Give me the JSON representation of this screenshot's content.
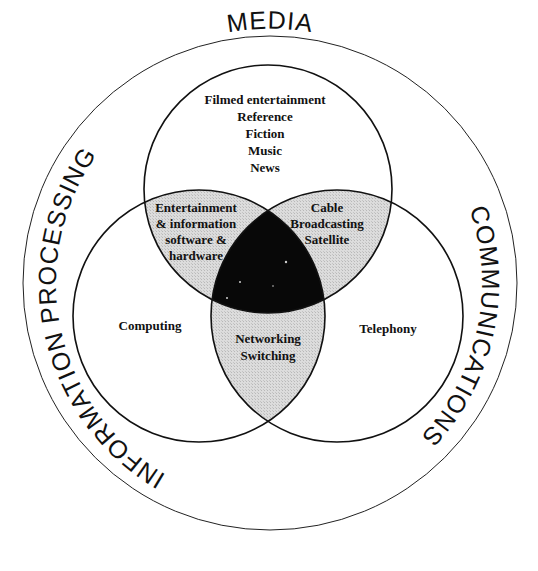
{
  "diagram": {
    "type": "venn",
    "outer_ring_labels": {
      "top": "MEDIA",
      "left": "INFORMATION PROCESSING",
      "right": "COMMUNICATIONS"
    },
    "sets": {
      "media": {
        "name": "Media",
        "items": [
          "Filmed entertainment",
          "Reference",
          "Fiction",
          "Music",
          "News"
        ]
      },
      "information_processing": {
        "name": "Information Processing",
        "items": [
          "Computing"
        ]
      },
      "communications": {
        "name": "Communications",
        "items": [
          "Telephony"
        ]
      }
    },
    "intersections": {
      "media_information": {
        "items": [
          "Entertainment",
          "& information",
          "software &",
          "hardware"
        ]
      },
      "media_communications": {
        "items": [
          "Cable",
          "Broadcasting",
          "Satellite"
        ]
      },
      "information_communications": {
        "items": [
          "Networking",
          "Switching"
        ]
      },
      "all_three": {
        "items": []
      }
    },
    "colors": {
      "pairwise_fill": "#d9d9d9",
      "triple_fill": "#080808",
      "stroke": "#111111",
      "background": "#ffffff"
    }
  }
}
